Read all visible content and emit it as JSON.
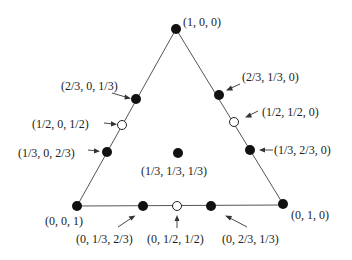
{
  "diagram": {
    "type": "simplex-triangle",
    "vertices": {
      "top": {
        "label": "(1, 0, 0)"
      },
      "bottom_left": {
        "label": "(0, 0, 1)"
      },
      "bottom_right": {
        "label": "(0, 1, 0)"
      }
    },
    "points": [
      {
        "id": "p100",
        "label": "(1, 0, 0)",
        "style": "filled"
      },
      {
        "id": "p23013",
        "label": "(2/3, 0, 1/3)",
        "style": "filled"
      },
      {
        "id": "p12012",
        "label": "(1/2, 0, 1/2)",
        "style": "open"
      },
      {
        "id": "p13023",
        "label": "(1/3, 0, 2/3)",
        "style": "filled"
      },
      {
        "id": "p23130",
        "label": "(2/3, 1/3, 0)",
        "style": "filled"
      },
      {
        "id": "p12120",
        "label": "(1/2, 1/2, 0)",
        "style": "open"
      },
      {
        "id": "p13230",
        "label": "(1/3, 2/3, 0)",
        "style": "filled"
      },
      {
        "id": "p131313",
        "label": "(1/3, 1/3, 1/3)",
        "style": "filled"
      },
      {
        "id": "p001",
        "label": "(0, 0, 1)",
        "style": "filled"
      },
      {
        "id": "p01323",
        "label": "(0, 1/3, 2/3)",
        "style": "filled"
      },
      {
        "id": "p01212",
        "label": "(0, 1/2, 1/2)",
        "style": "open"
      },
      {
        "id": "p02313",
        "label": "(0, 2/3, 1/3)",
        "style": "filled"
      },
      {
        "id": "p010",
        "label": "(0, 1, 0)",
        "style": "filled"
      }
    ]
  }
}
